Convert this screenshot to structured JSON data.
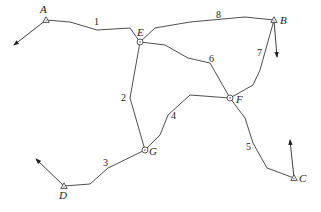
{
  "diagram": {
    "type": "network",
    "colors": {
      "line": "#3a3a3a",
      "text": "#222222",
      "background": "#ffffff"
    },
    "nodes": [
      {
        "id": "A",
        "label": "A",
        "kind": "control-point-triangle",
        "x": 46,
        "y": 20,
        "lx": 40,
        "ly": 13
      },
      {
        "id": "B",
        "label": "B",
        "kind": "control-point-triangle",
        "x": 274,
        "y": 20,
        "lx": 280,
        "ly": 24
      },
      {
        "id": "C",
        "label": "C",
        "kind": "control-point-triangle",
        "x": 294,
        "y": 178,
        "lx": 299,
        "ly": 182
      },
      {
        "id": "D",
        "label": "D",
        "kind": "control-point-triangle",
        "x": 64,
        "y": 186,
        "lx": 59,
        "ly": 199
      },
      {
        "id": "E",
        "label": "E",
        "kind": "junction-circle",
        "x": 140,
        "y": 42,
        "lx": 137,
        "ly": 36
      },
      {
        "id": "F",
        "label": "F",
        "kind": "junction-circle",
        "x": 230,
        "y": 98,
        "lx": 236,
        "ly": 103
      },
      {
        "id": "G",
        "label": "G",
        "kind": "junction-circle",
        "x": 145,
        "y": 150,
        "lx": 149,
        "ly": 155
      }
    ],
    "edges": [
      {
        "label": "1",
        "from": "A",
        "to": "E",
        "points": "46,20 70,22 97,30 130,28 140,42",
        "lx": 94,
        "ly": 25
      },
      {
        "label": "2",
        "from": "E",
        "to": "G",
        "points": "140,42 130,98 145,150",
        "lx": 121,
        "ly": 101
      },
      {
        "label": "3",
        "from": "D",
        "to": "G",
        "points": "64,186 90,184 108,168 145,150",
        "lx": 103,
        "ly": 166
      },
      {
        "label": "4",
        "from": "G",
        "to": "F",
        "points": "145,150 160,135 168,115 190,95 230,98",
        "lx": 171,
        "ly": 119
      },
      {
        "label": "5",
        "from": "F",
        "to": "C",
        "points": "230,98 245,118 253,143 267,168 294,178",
        "lx": 246,
        "ly": 150
      },
      {
        "label": "6",
        "from": "E",
        "to": "F",
        "points": "140,42 165,45 188,58 210,63 230,98",
        "lx": 209,
        "ly": 62
      },
      {
        "label": "7",
        "from": "B",
        "to": "F",
        "points": "274,20 260,70 253,85 230,98",
        "lx": 257,
        "ly": 56
      },
      {
        "label": "8",
        "from": "E",
        "to": "B",
        "points": "140,42 155,28 190,22 245,17 274,20",
        "lx": 216,
        "ly": 18
      }
    ],
    "orientation_arrows": [
      {
        "at": "A",
        "x1": 46,
        "y1": 20,
        "x2": 14,
        "y2": 45
      },
      {
        "at": "B",
        "x1": 274,
        "y1": 20,
        "x2": 277,
        "y2": 57
      },
      {
        "at": "C",
        "x1": 294,
        "y1": 178,
        "x2": 290,
        "y2": 140
      },
      {
        "at": "D",
        "x1": 64,
        "y1": 186,
        "x2": 36,
        "y2": 159
      }
    ]
  }
}
